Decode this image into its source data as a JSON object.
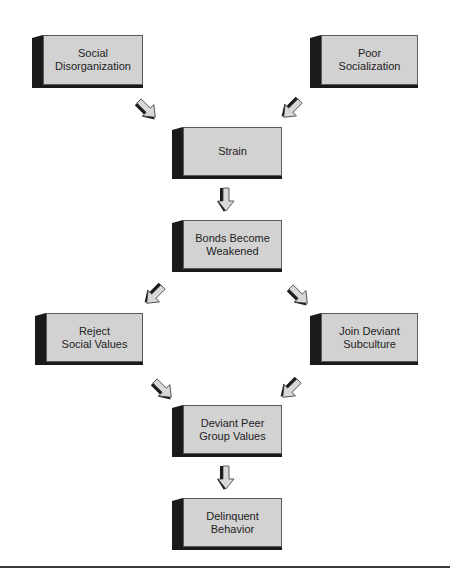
{
  "diagram": {
    "type": "flowchart",
    "nodes": [
      {
        "id": "social_disorganization",
        "lines": [
          "Social",
          "Disorganization"
        ]
      },
      {
        "id": "poor_socialization",
        "lines": [
          "Poor",
          "Socialization"
        ]
      },
      {
        "id": "strain",
        "lines": [
          "Strain"
        ]
      },
      {
        "id": "bonds_weakened",
        "lines": [
          "Bonds Become",
          "Weakened"
        ]
      },
      {
        "id": "reject_social_values",
        "lines": [
          "Reject",
          "Social Values"
        ]
      },
      {
        "id": "join_deviant_subculture",
        "lines": [
          "Join Deviant",
          "Subculture"
        ]
      },
      {
        "id": "deviant_peer_group_values",
        "lines": [
          "Deviant Peer",
          "Group Values"
        ]
      },
      {
        "id": "delinquent_behavior",
        "lines": [
          "Delinquent",
          "Behavior"
        ]
      }
    ],
    "edges": [
      {
        "from": "social_disorganization",
        "to": "strain"
      },
      {
        "from": "poor_socialization",
        "to": "strain"
      },
      {
        "from": "strain",
        "to": "bonds_weakened"
      },
      {
        "from": "bonds_weakened",
        "to": "reject_social_values"
      },
      {
        "from": "bonds_weakened",
        "to": "join_deviant_subculture"
      },
      {
        "from": "reject_social_values",
        "to": "deviant_peer_group_values"
      },
      {
        "from": "join_deviant_subculture",
        "to": "deviant_peer_group_values"
      },
      {
        "from": "deviant_peer_group_values",
        "to": "delinquent_behavior"
      }
    ],
    "colors": {
      "box_face": "#d2d2d2",
      "box_shadow": "#1a1a1a",
      "arrow_fill": "#d8d8d8",
      "arrow_shadow": "#1a1a1a"
    }
  }
}
